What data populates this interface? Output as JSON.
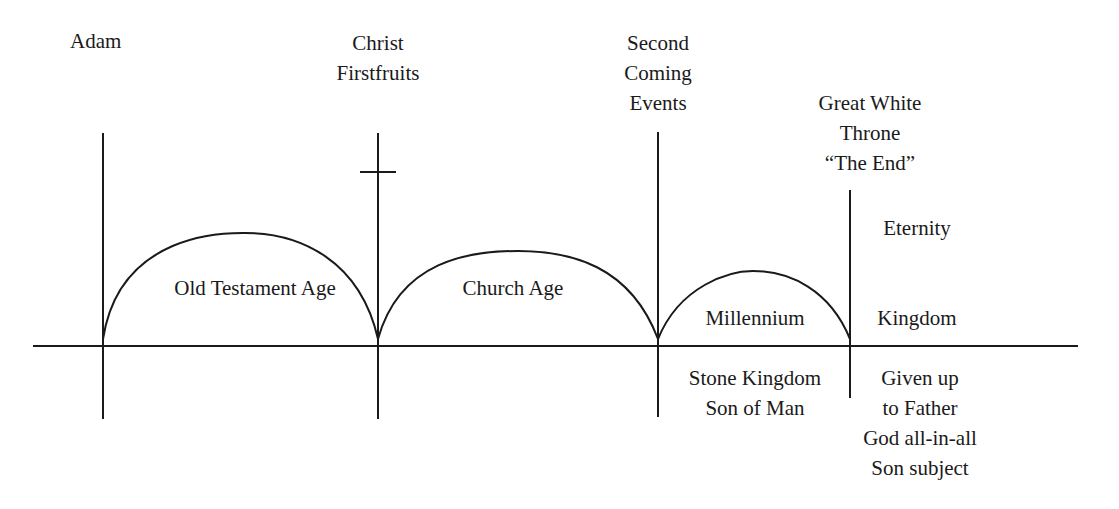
{
  "diagram": {
    "title_events": [
      {
        "id": "adam",
        "lines": [
          "Adam"
        ]
      },
      {
        "id": "christ",
        "lines": [
          "Christ",
          "Firstfruits"
        ]
      },
      {
        "id": "second-coming",
        "lines": [
          "Second",
          "Coming",
          "Events"
        ]
      },
      {
        "id": "great-white-throne",
        "lines": [
          "Great White",
          "Throne",
          "“The End”"
        ]
      }
    ],
    "ages": [
      {
        "id": "old-testament",
        "label": "Old Testament Age"
      },
      {
        "id": "church",
        "label": "Church Age"
      },
      {
        "id": "millennium",
        "label": "Millennium",
        "below": [
          "Stone Kingdom",
          "Son of Man"
        ]
      },
      {
        "id": "eternity",
        "top": "Eternity",
        "label": "Kingdom",
        "below": [
          "Given up",
          "to Father",
          "God all-in-all",
          "Son subject"
        ]
      }
    ],
    "colors": {
      "line": "#1a1a1a",
      "background": "#ffffff"
    }
  }
}
